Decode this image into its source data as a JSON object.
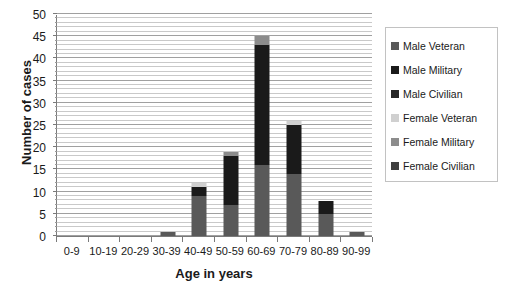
{
  "chart_data": {
    "type": "bar",
    "stacked": true,
    "title": "",
    "xlabel": "Age in years",
    "ylabel": "Number of cases",
    "categories": [
      "0-9",
      "10-19",
      "20-29",
      "30-39",
      "40-49",
      "50-59",
      "60-69",
      "70-79",
      "80-89",
      "90-99"
    ],
    "ylim": [
      0,
      50
    ],
    "ytick_step": 5,
    "yticks": [
      0,
      5,
      10,
      15,
      20,
      25,
      30,
      35,
      40,
      45,
      50
    ],
    "minor_gridline_step": 1,
    "grid": true,
    "legend_position": "right",
    "series": [
      {
        "name": "Male Veteran",
        "color": "#595959",
        "values": [
          0,
          0,
          0,
          1,
          9,
          7,
          16,
          14,
          5,
          1
        ]
      },
      {
        "name": "Male Military",
        "color": "#1a1a1a",
        "values": [
          0,
          0,
          0,
          0,
          2,
          11,
          27,
          11,
          3,
          0
        ]
      },
      {
        "name": "Male Civilian",
        "color": "#262626",
        "values": [
          0,
          0,
          0,
          0,
          0,
          0,
          0,
          0,
          0,
          0
        ]
      },
      {
        "name": "Female Veteran",
        "color": "#d0d0d0",
        "values": [
          0,
          0,
          0,
          0,
          1,
          0,
          0,
          1,
          0,
          0
        ]
      },
      {
        "name": "Female Military",
        "color": "#8c8c8c",
        "values": [
          0,
          0,
          0,
          0,
          0,
          1,
          2,
          0,
          0,
          0
        ]
      },
      {
        "name": "Female Civilian",
        "color": "#3f3f3f",
        "values": [
          0,
          0,
          0,
          0,
          0,
          0,
          0,
          0,
          0,
          0
        ]
      }
    ],
    "totals": [
      0,
      0,
      0,
      1,
      12,
      19,
      45,
      26,
      8,
      1
    ]
  },
  "legend": {
    "items": [
      {
        "label": "Male Veteran",
        "color": "#595959"
      },
      {
        "label": "Male Military",
        "color": "#1a1a1a"
      },
      {
        "label": "Male Civilian",
        "color": "#262626"
      },
      {
        "label": "Female Veteran",
        "color": "#d0d0d0"
      },
      {
        "label": "Female Military",
        "color": "#8c8c8c"
      },
      {
        "label": "Female Civilian",
        "color": "#3f3f3f"
      }
    ]
  }
}
